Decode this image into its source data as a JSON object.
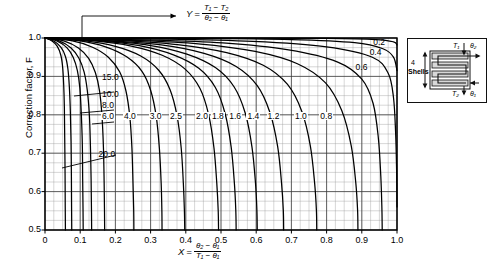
{
  "chart_data": {
    "type": "line",
    "title": "",
    "xlabel": "X = (theta2 - theta1) / (T1 - theta1)",
    "ylabel": "Correction factor, F",
    "xlim": [
      0,
      1.0
    ],
    "ylim": [
      0.5,
      1.0
    ],
    "xticks": [
      "0",
      "0.1",
      "0.2",
      "0.3",
      "0.4",
      "0.5",
      "0.6",
      "0.7",
      "0.8",
      "0.9",
      "1.0"
    ],
    "yticks": [
      "1.0",
      "0.9",
      "0.8",
      "0.7",
      "0.6",
      "0.5"
    ],
    "grid": true,
    "minor_grid": true,
    "x_minor_step": 0.025,
    "y_minor_step": 0.025,
    "legend": "inline-curve-labels",
    "series_parameter": "Y",
    "series": [
      {
        "name": "20.0",
        "label": "20.0",
        "label_x": 0.175,
        "label_y": 0.695,
        "points": [
          [
            0.0,
            1.0
          ],
          [
            0.02,
            0.992
          ],
          [
            0.035,
            0.978
          ],
          [
            0.045,
            0.955
          ],
          [
            0.05,
            0.925
          ],
          [
            0.053,
            0.88
          ],
          [
            0.055,
            0.82
          ],
          [
            0.056,
            0.74
          ],
          [
            0.057,
            0.65
          ],
          [
            0.0575,
            0.56
          ],
          [
            0.058,
            0.5
          ]
        ]
      },
      {
        "name": "15.0",
        "label": "15.0",
        "label_x": 0.185,
        "label_y": 0.895,
        "points": [
          [
            0.0,
            1.0
          ],
          [
            0.025,
            0.992
          ],
          [
            0.045,
            0.976
          ],
          [
            0.058,
            0.952
          ],
          [
            0.065,
            0.92
          ],
          [
            0.069,
            0.875
          ],
          [
            0.072,
            0.81
          ],
          [
            0.074,
            0.73
          ],
          [
            0.075,
            0.64
          ],
          [
            0.0755,
            0.56
          ],
          [
            0.076,
            0.5
          ]
        ]
      },
      {
        "name": "10.0",
        "label": "10.0",
        "label_x": 0.185,
        "label_y": 0.852,
        "points": [
          [
            0.0,
            1.0
          ],
          [
            0.035,
            0.992
          ],
          [
            0.062,
            0.975
          ],
          [
            0.08,
            0.95
          ],
          [
            0.092,
            0.915
          ],
          [
            0.099,
            0.87
          ],
          [
            0.103,
            0.805
          ],
          [
            0.106,
            0.725
          ],
          [
            0.107,
            0.635
          ],
          [
            0.108,
            0.555
          ],
          [
            0.1085,
            0.5
          ]
        ]
      },
      {
        "name": "8.0",
        "label": "8.0",
        "label_x": 0.185,
        "label_y": 0.822,
        "points": [
          [
            0.0,
            1.0
          ],
          [
            0.042,
            0.992
          ],
          [
            0.074,
            0.974
          ],
          [
            0.096,
            0.948
          ],
          [
            0.111,
            0.912
          ],
          [
            0.12,
            0.865
          ],
          [
            0.126,
            0.8
          ],
          [
            0.129,
            0.72
          ],
          [
            0.131,
            0.63
          ],
          [
            0.132,
            0.555
          ],
          [
            0.1325,
            0.5
          ]
        ]
      },
      {
        "name": "6.0",
        "label": "6.0",
        "label_x": 0.185,
        "label_y": 0.795,
        "points": [
          [
            0.0,
            1.0
          ],
          [
            0.055,
            0.992
          ],
          [
            0.095,
            0.974
          ],
          [
            0.124,
            0.947
          ],
          [
            0.143,
            0.91
          ],
          [
            0.155,
            0.862
          ],
          [
            0.162,
            0.795
          ],
          [
            0.166,
            0.715
          ],
          [
            0.168,
            0.625
          ],
          [
            0.169,
            0.552
          ],
          [
            0.1695,
            0.5
          ]
        ]
      },
      {
        "name": "4.0",
        "label": "4.0",
        "label_x": 0.247,
        "label_y": 0.795,
        "points": [
          [
            0.0,
            1.0
          ],
          [
            0.075,
            0.993
          ],
          [
            0.135,
            0.976
          ],
          [
            0.18,
            0.95
          ],
          [
            0.212,
            0.912
          ],
          [
            0.23,
            0.862
          ],
          [
            0.241,
            0.795
          ],
          [
            0.247,
            0.712
          ],
          [
            0.25,
            0.622
          ],
          [
            0.252,
            0.552
          ],
          [
            0.2525,
            0.5
          ]
        ]
      },
      {
        "name": "3.0",
        "label": "3.0",
        "label_x": 0.32,
        "label_y": 0.795,
        "points": [
          [
            0.0,
            1.0
          ],
          [
            0.095,
            0.993
          ],
          [
            0.172,
            0.977
          ],
          [
            0.232,
            0.951
          ],
          [
            0.275,
            0.914
          ],
          [
            0.3,
            0.864
          ],
          [
            0.316,
            0.796
          ],
          [
            0.325,
            0.712
          ],
          [
            0.33,
            0.622
          ],
          [
            0.332,
            0.552
          ],
          [
            0.3325,
            0.5
          ]
        ]
      },
      {
        "name": "2.5",
        "label": "2.5",
        "label_x": 0.378,
        "label_y": 0.795,
        "points": [
          [
            0.0,
            1.0
          ],
          [
            0.11,
            0.993
          ],
          [
            0.2,
            0.978
          ],
          [
            0.272,
            0.953
          ],
          [
            0.323,
            0.916
          ],
          [
            0.355,
            0.866
          ],
          [
            0.375,
            0.798
          ],
          [
            0.387,
            0.713
          ],
          [
            0.393,
            0.622
          ],
          [
            0.396,
            0.552
          ],
          [
            0.397,
            0.5
          ]
        ]
      },
      {
        "name": "2.0",
        "label": "2.0",
        "label_x": 0.452,
        "label_y": 0.795,
        "points": [
          [
            0.0,
            1.0
          ],
          [
            0.135,
            0.993
          ],
          [
            0.245,
            0.979
          ],
          [
            0.333,
            0.955
          ],
          [
            0.398,
            0.919
          ],
          [
            0.44,
            0.869
          ],
          [
            0.465,
            0.8
          ],
          [
            0.48,
            0.714
          ],
          [
            0.488,
            0.622
          ],
          [
            0.492,
            0.552
          ],
          [
            0.493,
            0.5
          ]
        ]
      },
      {
        "name": "1.8",
        "label": "1.8",
        "label_x": 0.497,
        "label_y": 0.795,
        "points": [
          [
            0.0,
            1.0
          ],
          [
            0.148,
            0.993
          ],
          [
            0.268,
            0.98
          ],
          [
            0.365,
            0.956
          ],
          [
            0.437,
            0.921
          ],
          [
            0.484,
            0.871
          ],
          [
            0.512,
            0.802
          ],
          [
            0.529,
            0.715
          ],
          [
            0.538,
            0.622
          ],
          [
            0.542,
            0.552
          ],
          [
            0.543,
            0.5
          ]
        ]
      },
      {
        "name": "1.6",
        "label": "1.6",
        "label_x": 0.546,
        "label_y": 0.795,
        "points": [
          [
            0.0,
            1.0
          ],
          [
            0.163,
            0.993
          ],
          [
            0.296,
            0.981
          ],
          [
            0.403,
            0.958
          ],
          [
            0.484,
            0.923
          ],
          [
            0.537,
            0.873
          ],
          [
            0.569,
            0.804
          ],
          [
            0.588,
            0.716
          ],
          [
            0.598,
            0.622
          ],
          [
            0.602,
            0.552
          ],
          [
            0.603,
            0.5
          ]
        ]
      },
      {
        "name": "1.4",
        "label": "1.4",
        "label_x": 0.598,
        "label_y": 0.795,
        "points": [
          [
            0.0,
            1.0
          ],
          [
            0.182,
            0.993
          ],
          [
            0.33,
            0.982
          ],
          [
            0.452,
            0.96
          ],
          [
            0.543,
            0.926
          ],
          [
            0.603,
            0.876
          ],
          [
            0.639,
            0.806
          ],
          [
            0.661,
            0.717
          ],
          [
            0.672,
            0.622
          ],
          [
            0.677,
            0.552
          ],
          [
            0.678,
            0.5
          ]
        ]
      },
      {
        "name": "1.2",
        "label": "1.2",
        "label_x": 0.655,
        "label_y": 0.795,
        "points": [
          [
            0.0,
            1.0
          ],
          [
            0.208,
            0.994
          ],
          [
            0.376,
            0.983
          ],
          [
            0.516,
            0.962
          ],
          [
            0.62,
            0.929
          ],
          [
            0.689,
            0.879
          ],
          [
            0.73,
            0.808
          ],
          [
            0.754,
            0.718
          ],
          [
            0.766,
            0.622
          ],
          [
            0.771,
            0.552
          ],
          [
            0.772,
            0.5
          ]
        ]
      },
      {
        "name": "1.0",
        "label": "1.0",
        "label_x": 0.733,
        "label_y": 0.795,
        "points": [
          [
            0.0,
            1.0
          ],
          [
            0.24,
            0.994
          ],
          [
            0.435,
            0.985
          ],
          [
            0.597,
            0.965
          ],
          [
            0.717,
            0.933
          ],
          [
            0.797,
            0.883
          ],
          [
            0.843,
            0.811
          ],
          [
            0.87,
            0.719
          ],
          [
            0.883,
            0.622
          ],
          [
            0.888,
            0.552
          ],
          [
            0.889,
            0.5
          ]
        ]
      },
      {
        "name": "0.8",
        "label": "0.8",
        "label_x": 0.805,
        "label_y": 0.795,
        "points": [
          [
            0.0,
            1.0
          ],
          [
            0.28,
            0.995
          ],
          [
            0.505,
            0.987
          ],
          [
            0.692,
            0.969
          ],
          [
            0.83,
            0.938
          ],
          [
            0.9,
            0.893
          ],
          [
            0.932,
            0.83
          ],
          [
            0.947,
            0.74
          ],
          [
            0.954,
            0.64
          ],
          [
            0.957,
            0.56
          ],
          [
            0.958,
            0.5
          ]
        ]
      },
      {
        "name": "0.6",
        "label": "0.6",
        "label_x": 0.905,
        "label_y": 0.922,
        "points": [
          [
            0.0,
            1.0
          ],
          [
            0.33,
            0.997
          ],
          [
            0.59,
            0.991
          ],
          [
            0.8,
            0.977
          ],
          [
            0.93,
            0.95
          ],
          [
            0.975,
            0.908
          ],
          [
            0.99,
            0.845
          ],
          [
            0.996,
            0.755
          ],
          [
            0.999,
            0.65
          ],
          [
            1.0,
            0.56
          ]
        ]
      },
      {
        "name": "0.4",
        "label": "0.4",
        "label_x": 0.945,
        "label_y": 0.962,
        "points": [
          [
            0.0,
            1.0
          ],
          [
            0.4,
            0.999
          ],
          [
            0.7,
            0.996
          ],
          [
            0.88,
            0.988
          ],
          [
            0.96,
            0.972
          ],
          [
            0.99,
            0.95
          ],
          [
            1.0,
            0.915
          ]
        ]
      },
      {
        "name": "0.2",
        "label": "0.2",
        "label_x": 0.955,
        "label_y": 0.988,
        "points": [
          [
            0.0,
            1.0
          ],
          [
            0.5,
            1.0
          ],
          [
            0.8,
            0.999
          ],
          [
            0.94,
            0.996
          ],
          [
            0.99,
            0.99
          ],
          [
            1.0,
            0.982
          ]
        ]
      }
    ],
    "annotations": {
      "y_equation_leader": "arrow from curve bundle to Y definition",
      "label_20_leader": "leader line from 20.0 label down-left to its curve"
    }
  },
  "axes": {
    "y_title": "Correction factor, F",
    "x_symbol": "X",
    "x_numerator": "θ₂ − θ₁",
    "x_denominator": "T₁ − θ₁",
    "y_symbol": "Y",
    "y_numerator": "T₁ − T₂",
    "y_denominator": "θ₂ − θ₁",
    "equals": "="
  },
  "inset": {
    "name": "shell-and-tube-heat-exchanger-diagram",
    "shell_count_label": "4",
    "shell_word": "Shells",
    "top_left_label": "T₁",
    "top_right_label": "θ₂",
    "bottom_left_label": "T₂",
    "bottom_right_label": "θ₁"
  }
}
